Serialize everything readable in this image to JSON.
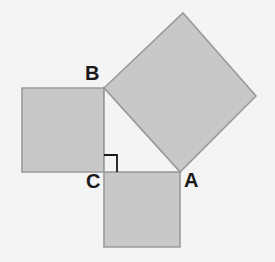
{
  "figure": {
    "background_color": "#f4f4f4",
    "square_fill_color": "#c8c8c8",
    "square_stroke_color": "#9a9a9a",
    "label_color": "#1a1a1a",
    "right_angle_marker_color": "#1a1a1a"
  },
  "labels": {
    "vertex_a": "A",
    "vertex_b": "B",
    "vertex_c": "C"
  },
  "label_positions": {
    "vertex_a": {
      "x": 184,
      "y": 187
    },
    "vertex_b": {
      "x": 85,
      "y": 80
    },
    "vertex_c": {
      "x": 86,
      "y": 188
    }
  },
  "geometry": {
    "vertices": {
      "A": {
        "x": 180,
        "y": 172
      },
      "B": {
        "x": 104,
        "y": 88
      },
      "C": {
        "x": 104,
        "y": 172
      }
    },
    "triangle_points": "104,88 180,172 104,172",
    "squares": [
      {
        "name": "square-on-leg-cb",
        "description": "square built outward on vertical leg C-B (left side)",
        "points": "104,88 104,172 22,172 22,88"
      },
      {
        "name": "square-on-leg-ca",
        "description": "square built outward on horizontal leg C-A (below)",
        "points": "104,172 180,172 180,247 104,247"
      },
      {
        "name": "square-on-hypotenuse-ab",
        "description": "rotated square built outward on hypotenuse A-B (upper right)",
        "points": "104,88 183,13 256,96 180,172"
      }
    ],
    "right_angle_marker": {
      "at_vertex": "C",
      "path": "M 104 155 L 117 155 L 117 172"
    }
  }
}
